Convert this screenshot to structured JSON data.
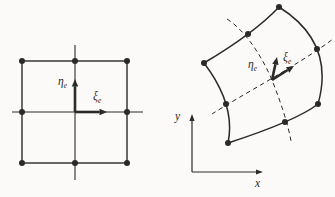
{
  "figure": {
    "colors": {
      "background": "#fbfaf8",
      "ink": "#2a2a2a"
    },
    "node_radius": 3,
    "labels": {
      "eta_left": {
        "main": "η",
        "sub": "e"
      },
      "xi_left": {
        "main": "ξ",
        "sub": "e"
      },
      "eta_right": {
        "main": "η",
        "sub": "e"
      },
      "xi_right": {
        "main": "ξ",
        "sub": "e"
      },
      "x_global": "x",
      "y_global": "y"
    },
    "reference_element": {
      "outline": {
        "x": 22,
        "y": 61,
        "width": 105,
        "height": 102
      },
      "crosshair": {
        "horizontal": {
          "x1": 12,
          "y1": 112,
          "x2": 143,
          "y2": 112
        },
        "vertical": {
          "x1": 75,
          "y1": 45,
          "x2": 75,
          "y2": 180
        }
      },
      "nodes": [
        [
          22,
          61
        ],
        [
          75,
          61
        ],
        [
          127,
          61
        ],
        [
          22,
          112
        ],
        [
          127,
          112
        ],
        [
          22,
          163
        ],
        [
          75,
          163
        ],
        [
          127,
          163
        ]
      ],
      "axis_arrows": {
        "origin": [
          75,
          112
        ],
        "eta_tip": [
          75,
          79
        ],
        "xi_tip": [
          107,
          112
        ]
      },
      "label_pos": {
        "eta": [
          58,
          85
        ],
        "xi": [
          93,
          100
        ]
      }
    },
    "mapped_element": {
      "outline_path": "M 204,63 Q 254.5,33 279,7 Q 335.5,42.5 318,104 Q 297,120.5 228,143 Q 236,105 204,63 Z",
      "dashed_xi_path": "M 212,114 C 240,96 300,64 333,39",
      "dashed_eta_path": "M 227,19 C 243,29 260,52 272,80 C 281,103 288,124 291,141",
      "nodes": [
        [
          279,
          7
        ],
        [
          248,
          34
        ],
        [
          204,
          63
        ],
        [
          317,
          49
        ],
        [
          318,
          104
        ],
        [
          226,
          104
        ],
        [
          285,
          122
        ],
        [
          228,
          143
        ]
      ],
      "axis_arrows": {
        "origin": [
          272,
          80
        ],
        "eta_tip": [
          277,
          57
        ],
        "xi_tip": [
          294,
          66
        ]
      },
      "label_pos": {
        "eta": [
          248,
          68
        ],
        "xi": [
          283,
          61
        ]
      }
    },
    "global_axes": {
      "origin": [
        192,
        172
      ],
      "x_tip": [
        263,
        172
      ],
      "y_tip": [
        192,
        114
      ],
      "label_pos": {
        "x": [
          255,
          187
        ],
        "y": [
          175,
          120
        ]
      }
    }
  }
}
